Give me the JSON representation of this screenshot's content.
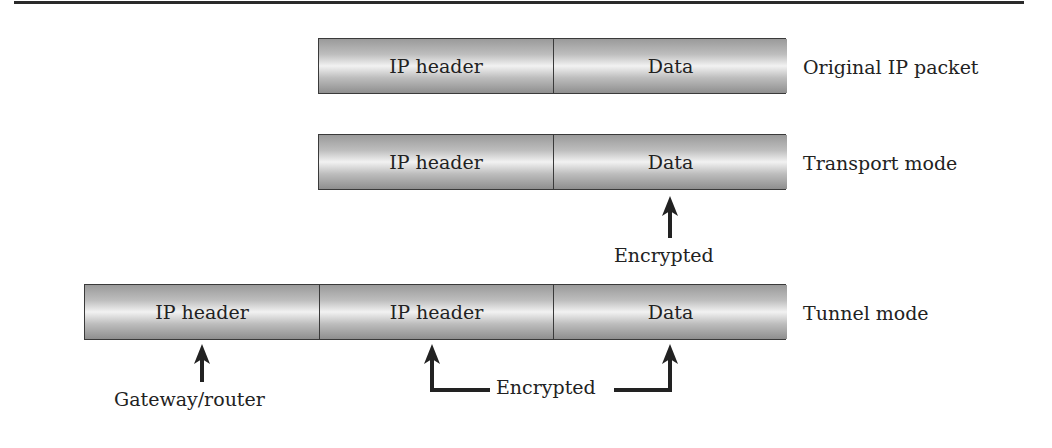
{
  "diagram": {
    "rows": [
      {
        "name": "original",
        "label": "Original IP packet",
        "cells": [
          "IP header",
          "Data"
        ]
      },
      {
        "name": "transport",
        "label": "Transport mode",
        "cells": [
          "IP header",
          "Data"
        ]
      },
      {
        "name": "tunnel",
        "label": "Tunnel mode",
        "cells": [
          "IP header",
          "IP header",
          "Data"
        ]
      }
    ],
    "annotations": {
      "transport_encrypted": "Encrypted",
      "tunnel_encrypted": "Encrypted",
      "gateway": "Gateway/router"
    },
    "colors": {
      "box_border": "#3a3a3a",
      "box_light": "#f2f2f2",
      "box_dark": "#9a9a9a",
      "text": "#222222"
    }
  }
}
